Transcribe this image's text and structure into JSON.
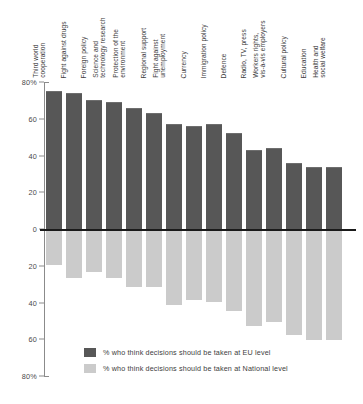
{
  "chart_data": {
    "type": "bar",
    "title": "",
    "subtitle": "",
    "xlabel": "",
    "ylabel": "",
    "grid": false,
    "orientation": "vertical-diverging",
    "legend_position": "bottom-left",
    "ylim": [
      -80,
      80
    ],
    "ytick_labels": [
      "80%",
      "60",
      "40",
      "20",
      "0",
      "20",
      "40",
      "60",
      "80%"
    ],
    "ytick_values": [
      80,
      60,
      40,
      20,
      0,
      -20,
      -40,
      -60,
      -80
    ],
    "categories": [
      "Third world\ncooperation",
      "Fight against drugs",
      "Foreign policy",
      "Science and\ntechnology research",
      "Protection of the\nenvironment",
      "Regional support",
      "Fight against\nunemployment",
      "Currency",
      "Immigration policy",
      "Defence",
      "Radio, TV, press",
      "Workers rights,\nvis-à-vis employers",
      "Cultural policy",
      "Education",
      "Health and\nsocial welfare"
    ],
    "series": [
      {
        "name": "% who think decisions should be taken at EU level",
        "color": "#575757",
        "values": [
          75,
          74,
          70,
          69,
          66,
          63,
          57,
          56,
          57,
          52,
          43,
          44,
          36,
          34,
          34
        ]
      },
      {
        "name": "% who think decisions should be taken at National level",
        "color": "#cbcbcb",
        "values": [
          -19,
          -26,
          -23,
          -26,
          -31,
          -31,
          -41,
          -38,
          -39,
          -44,
          -52,
          -50,
          -57,
          -60,
          -60
        ]
      }
    ]
  },
  "legend": {
    "items": [
      {
        "label": "% who think decisions should be taken at EU level",
        "color": "#575757"
      },
      {
        "label": "% who think decisions should be taken at National level",
        "color": "#cbcbcb"
      }
    ]
  }
}
